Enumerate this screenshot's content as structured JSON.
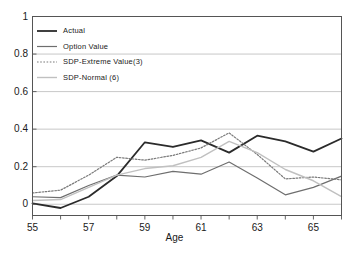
{
  "chart_data": {
    "type": "line",
    "title": "",
    "subtitle": "",
    "xlabel": "Age",
    "ylabel": "",
    "xlim": [
      55,
      66
    ],
    "ylim": [
      -0.06,
      1.0
    ],
    "xticks": [
      55,
      56,
      57,
      58,
      59,
      60,
      61,
      62,
      63,
      64,
      65,
      66
    ],
    "xtick_labels": [
      "55",
      "",
      "57",
      "",
      "59",
      "",
      "61",
      "",
      "63",
      "",
      "65",
      ""
    ],
    "yticks": [
      0,
      0.2,
      0.4,
      0.6,
      0.8,
      1
    ],
    "ytick_labels": [
      "0",
      "0.2",
      "0.4",
      "0.6",
      "0.8",
      "1"
    ],
    "grid": "horizontal",
    "legend_position": "top-left",
    "x": [
      55,
      56,
      57,
      58,
      59,
      60,
      61,
      62,
      63,
      64,
      65,
      66
    ],
    "series": [
      {
        "name": "Actual",
        "style": "solid",
        "color": "#2b2b2b",
        "width": 1.8,
        "values": [
          0.005,
          -0.02,
          0.04,
          0.15,
          0.33,
          0.305,
          0.34,
          0.275,
          0.365,
          0.335,
          0.28,
          0.35
        ]
      },
      {
        "name": "Option Value",
        "style": "solid",
        "color": "#6e6e6e",
        "width": 1.2,
        "values": [
          0.04,
          0.035,
          0.1,
          0.155,
          0.145,
          0.175,
          0.16,
          0.225,
          0.14,
          0.05,
          0.09,
          0.15
        ]
      },
      {
        "name": "SDP-Extreme Value(3)",
        "style": "dotted",
        "color": "#7a7a7a",
        "width": 1.2,
        "values": [
          0.06,
          0.075,
          0.155,
          0.25,
          0.235,
          0.26,
          0.3,
          0.38,
          0.265,
          0.135,
          0.145,
          0.13
        ]
      },
      {
        "name": "SDP-Normal (6)",
        "style": "solid",
        "color": "#c0c0c0",
        "width": 1.4,
        "values": [
          0.02,
          0.025,
          0.09,
          0.155,
          0.19,
          0.205,
          0.25,
          0.335,
          0.275,
          0.185,
          0.125,
          0.04
        ]
      }
    ]
  },
  "legend": {
    "entries": [
      {
        "label": "Actual"
      },
      {
        "label": "Option Value"
      },
      {
        "label": "SDP-Extreme Value(3)"
      },
      {
        "label": "SDP-Normal (6)"
      }
    ]
  }
}
